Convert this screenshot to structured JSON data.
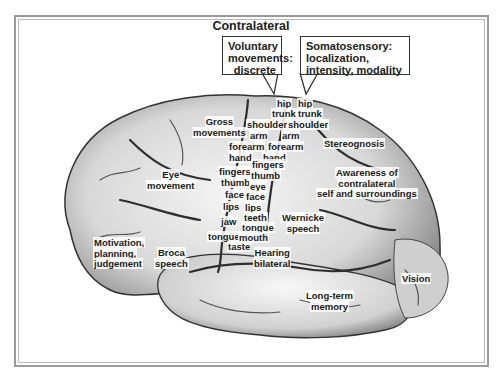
{
  "title": "Contralateral",
  "callouts": {
    "motor": [
      "Voluntary",
      "movements:",
      "discrete"
    ],
    "sensory": [
      "Somatosensory:",
      "localization,",
      "intensity, modality"
    ]
  },
  "labels": {
    "gross_movements": [
      "Gross",
      "movements"
    ],
    "eye_movement": [
      "Eye",
      "movement"
    ],
    "motivation": [
      "Motivation,",
      "planning,",
      "judgement"
    ],
    "broca": [
      "Broca",
      "speech"
    ],
    "motor_strip": [
      "hip",
      "trunk",
      "shoulder",
      "arm",
      "forearm",
      "hand",
      "fingers",
      "thumb",
      "face",
      "lips",
      "jaw",
      "tongue"
    ],
    "sensory_strip": [
      "hip",
      "trunk",
      "shoulder",
      "arm",
      "forearm",
      "hand",
      "fingers",
      "thumb",
      "eye",
      "face",
      "lips",
      "teeth",
      "tongue",
      "mouth"
    ],
    "taste": "taste",
    "hearing": [
      "Hearing",
      "bilateral"
    ],
    "wernicke": [
      "Wernicke",
      "speech"
    ],
    "stereognosis": "Stereognosis",
    "awareness": [
      "Awareness of",
      "contralateral",
      "self and surroundings"
    ],
    "long_term_memory": [
      "Long-term",
      "memory"
    ],
    "vision": "Vision"
  },
  "colors": {
    "frame": "#9a9a9a",
    "brain_light": "#f2f2f2",
    "brain_dark": "#3a3a3a",
    "text": "#1a1a1a"
  }
}
